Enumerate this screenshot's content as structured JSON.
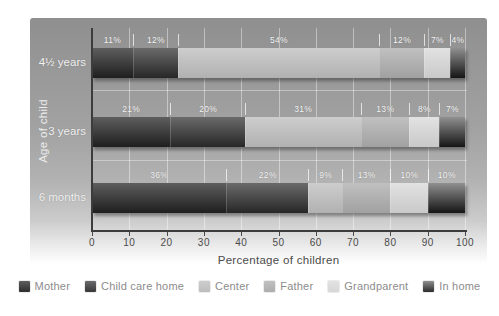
{
  "chart_data": {
    "type": "bar",
    "orientation": "horizontal-stacked",
    "title": "",
    "xlabel": "Percentage of children",
    "ylabel": "Age of child",
    "xlim": [
      0,
      100
    ],
    "xticks": [
      "0",
      "10",
      "20",
      "30",
      "40",
      "50",
      "60",
      "70",
      "80",
      "90",
      "100"
    ],
    "categories": [
      "4½ years",
      "3 years",
      "6 months"
    ],
    "series": [
      {
        "name": "Mother",
        "values": [
          11,
          21,
          36
        ],
        "color_top": "#5e5e5e",
        "color_bottom": "#1e1e1e",
        "legend_color": "#2d2d2d"
      },
      {
        "name": "Child care home",
        "values": [
          12,
          20,
          22
        ],
        "color_top": "#6a6a6a",
        "color_bottom": "#272727",
        "legend_color": "#383838"
      },
      {
        "name": "Center",
        "values": [
          54,
          31,
          9
        ],
        "color_top": "#cdcdcd",
        "color_bottom": "#b1b1b1",
        "legend_color": "#bdbdbd"
      },
      {
        "name": "Father",
        "values": [
          12,
          13,
          13
        ],
        "color_top": "#c0c0c0",
        "color_bottom": "#a1a1a1",
        "legend_color": "#adadad"
      },
      {
        "name": "Grandparent",
        "values": [
          7,
          8,
          10
        ],
        "color_top": "#e2e2e2",
        "color_bottom": "#c9c9c9",
        "legend_color": "#d7d7d7"
      },
      {
        "name": "In home",
        "values": [
          4,
          7,
          10
        ],
        "color_top": "#909090",
        "color_bottom": "#151515",
        "legend_color": "#2c2c2c"
      }
    ],
    "value_label_suffix": "%",
    "grid": true,
    "legend_position": "bottom"
  }
}
